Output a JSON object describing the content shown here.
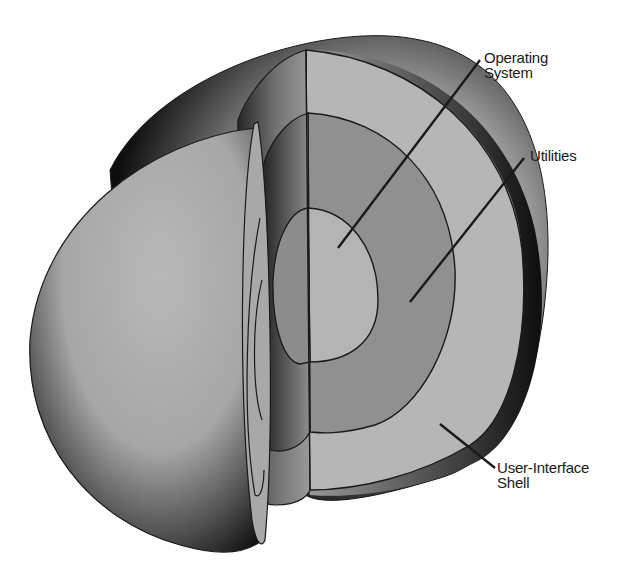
{
  "diagram": {
    "type": "layered-sphere-cutaway",
    "layers": [
      {
        "id": "operating-system",
        "label_lines": [
          "Operating",
          "System"
        ],
        "position": "core",
        "fill": "#b4b4b4"
      },
      {
        "id": "utilities",
        "label_lines": [
          "Utilities"
        ],
        "position": "middle",
        "fill": "#909090"
      },
      {
        "id": "user-interface-shell",
        "label_lines": [
          "User-Interface",
          "Shell"
        ],
        "position": "outer",
        "fill": "#b6b6b6"
      }
    ],
    "colors": {
      "background": "#ffffff",
      "outline": "#1a1a1a",
      "light_fill": "#b6b6b6",
      "mid_fill": "#909090",
      "shadow": "#111111"
    }
  }
}
